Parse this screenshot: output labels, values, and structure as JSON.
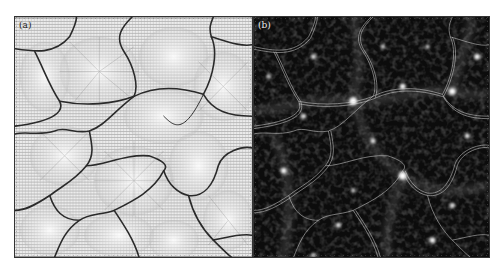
{
  "figure": {
    "panels": [
      {
        "id": "a",
        "label": "(a)",
        "description": "Grey shaded surface of cellular domains, with radial hatch/vector patterns and dark boundary curves",
        "background": "#e9e9e9",
        "line_color": "#2a2a2a"
      },
      {
        "id": "b",
        "label": "(b)",
        "description": "Dark density field with bright clumps and filaments, overlaid with thin white double-contour boundaries",
        "background": "#0d0d0d",
        "line_color": "#dddddd"
      }
    ]
  }
}
